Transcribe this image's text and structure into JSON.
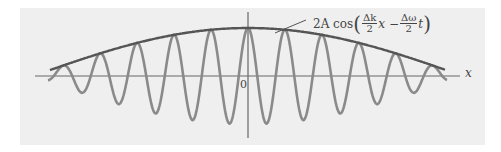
{
  "figure": {
    "formula": {
      "prefix": "2A cos",
      "frac1_num": "Δk",
      "frac1_den": "2",
      "mid": "x −",
      "frac2_num": "Δω",
      "frac2_den": "2",
      "suffix": "t"
    },
    "x_axis_label": "x",
    "origin_label": "0",
    "colors": {
      "background": "#efefef",
      "envelope": "#555555",
      "carrier": "#8a8a8a",
      "axis": "#666666"
    }
  },
  "chart_data": {
    "type": "line",
    "title": "",
    "xlabel": "x",
    "ylabel": "",
    "annotations": [
      "2A cos(Δk/2 x − Δω/2 t)",
      "0"
    ],
    "series": [
      {
        "name": "envelope 2A cos(Δk/2 x − Δω/2 t)",
        "description": "slow cosine envelope, max at x=0, crosses zero about midway to each edge"
      },
      {
        "name": "carrier wave",
        "description": "fast oscillation bounded by the envelope (beat pattern)"
      }
    ],
    "grid": false,
    "legend": "none"
  }
}
